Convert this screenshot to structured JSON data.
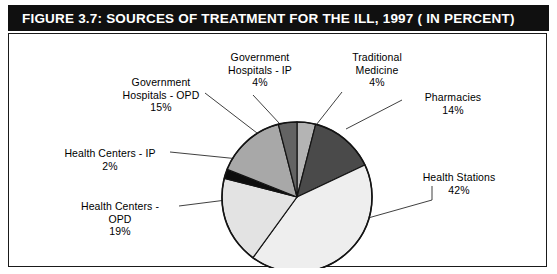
{
  "figure": {
    "title": "FIGURE 3.7:  SOURCES OF TREATMENT FOR THE ILL, 1997 ( IN PERCENT)",
    "banner_color": "#101010",
    "banner_text_color": "#ffffff",
    "frame_color": "#1a1a1a",
    "background": "#ffffff"
  },
  "labels": {
    "gov_hospitals_ip": "Government\nHospitals - IP\n4%",
    "traditional_medicine": "Traditional\nMedicine\n4%",
    "gov_hospitals_opd": "Government\nHospitals - OPD\n15%",
    "pharmacies": "Pharmacies\n14%",
    "health_centers_ip": "Health Centers - IP\n2%",
    "health_stations": "Health Stations\n42%",
    "health_centers_opd": "Health Centers -\nOPD\n19%"
  },
  "chart_data": {
    "type": "pie",
    "unit": "percent",
    "total": 100,
    "start_angle_deg": 0,
    "direction": "clockwise",
    "legend": "none (direct labels with leader lines)",
    "categories": [
      "Traditional Medicine",
      "Pharmacies",
      "Health Stations",
      "Health Centers - OPD",
      "Health Centers - IP",
      "Government Hospitals - OPD",
      "Government Hospitals - IP"
    ],
    "values": [
      4,
      14,
      42,
      19,
      2,
      15,
      4
    ],
    "slices": [
      {
        "label": "Traditional Medicine",
        "value": 4,
        "color": "#b4b4b4",
        "start_deg": 0,
        "end_deg": 14.4
      },
      {
        "label": "Pharmacies",
        "value": 14,
        "color": "#4a4a4a",
        "start_deg": 14.4,
        "end_deg": 64.8
      },
      {
        "label": "Health Stations",
        "value": 42,
        "color": "#eeeeee",
        "start_deg": 64.8,
        "end_deg": 216.0
      },
      {
        "label": "Health Centers - OPD",
        "value": 19,
        "color": "#e3e3e3",
        "start_deg": 216.0,
        "end_deg": 284.4
      },
      {
        "label": "Health Centers - IP",
        "value": 2,
        "color": "#0d0d0d",
        "start_deg": 284.4,
        "end_deg": 291.6
      },
      {
        "label": "Government Hospitals - OPD",
        "value": 15,
        "color": "#a8a8a8",
        "start_deg": 291.6,
        "end_deg": 345.6
      },
      {
        "label": "Government Hospitals - IP",
        "value": 4,
        "color": "#636363",
        "start_deg": 345.6,
        "end_deg": 360.0
      }
    ]
  }
}
